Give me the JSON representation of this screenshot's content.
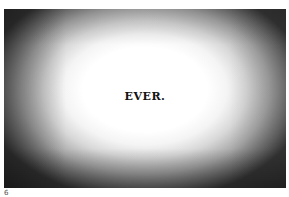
{
  "figure": {
    "headline": "EVER.",
    "style": {
      "center_color": "#ffffff",
      "edge_color": "#2a2a2a",
      "text_color": "#141414"
    }
  },
  "footer": {
    "page_number": "6"
  }
}
